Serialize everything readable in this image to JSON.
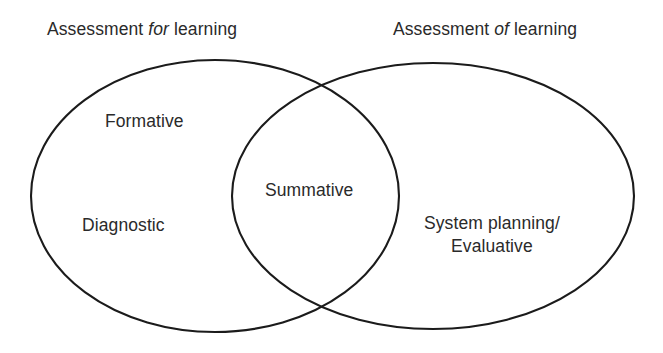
{
  "diagram": {
    "type": "venn",
    "title": "",
    "background_color": "#ffffff",
    "stroke_color": "#1b1b1b",
    "text_color": "#2a2a2a",
    "headers": {
      "left": {
        "prefix": "Assessment ",
        "emphasis": "for",
        "suffix": " learning",
        "full_text": "Assessment for learning"
      },
      "right": {
        "prefix": "Assessment ",
        "emphasis": "of",
        "suffix": " learning",
        "full_text": "Assessment of learning"
      }
    },
    "sets": {
      "left": {
        "name": "Assessment for learning",
        "exclusive_labels": [
          "Formative",
          "Diagnostic"
        ]
      },
      "right": {
        "name": "Assessment of learning",
        "exclusive_labels": [
          "System planning/\nEvaluative"
        ]
      },
      "intersection": {
        "labels": [
          "Summative"
        ]
      }
    },
    "labels": {
      "formative": "Formative",
      "diagnostic": "Diagnostic",
      "summative": "Summative",
      "system_planning_line1": "System planning/",
      "system_planning_line2": "Evaluative"
    }
  }
}
